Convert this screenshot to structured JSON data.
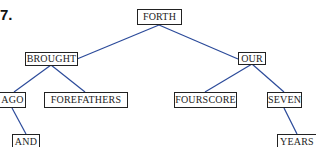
{
  "figure": {
    "number_label": "7.",
    "edge_color": "#2b4a9a"
  },
  "tree": {
    "nodes": {
      "forth": {
        "label": "FORTH"
      },
      "brought": {
        "label": "BROUGHT"
      },
      "our": {
        "label": "OUR"
      },
      "ago": {
        "label": "AGO"
      },
      "forefathers": {
        "label": "FOREFATHERS"
      },
      "fourscore": {
        "label": "FOURSCORE"
      },
      "seven": {
        "label": "SEVEN"
      },
      "and": {
        "label": "AND"
      },
      "years": {
        "label": "YEARS"
      }
    },
    "edges": [
      [
        "FORTH",
        "BROUGHT"
      ],
      [
        "FORTH",
        "OUR"
      ],
      [
        "BROUGHT",
        "AGO"
      ],
      [
        "BROUGHT",
        "FOREFATHERS"
      ],
      [
        "OUR",
        "FOURSCORE"
      ],
      [
        "OUR",
        "SEVEN"
      ],
      [
        "AGO",
        "AND"
      ],
      [
        "SEVEN",
        "YEARS"
      ]
    ]
  }
}
